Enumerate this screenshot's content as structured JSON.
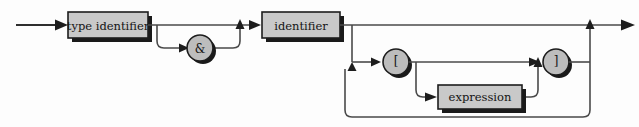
{
  "diagram": {
    "kind": "railroad-syntax-diagram",
    "title": "",
    "background_color": "#fdfdfd",
    "line_color": "#4a4a4a",
    "node_fill": "#c9c9c9",
    "circle_fill": "#bdbdbd",
    "node_border_color": "#1d1d1d",
    "shadow_color": "#1a1a1a",
    "text_color": "#141414",
    "nodes": [
      {
        "id": "type-identifier",
        "shape": "box",
        "label": "type identifier",
        "x": 68,
        "y": 12,
        "w": 80,
        "h": 26
      },
      {
        "id": "ampersand",
        "shape": "circle",
        "label": "&",
        "cx": 200,
        "cy": 48,
        "r": 13
      },
      {
        "id": "identifier",
        "shape": "box",
        "label": "identifier",
        "x": 262,
        "y": 12,
        "w": 78,
        "h": 26
      },
      {
        "id": "open-bracket",
        "shape": "circle",
        "label": "[",
        "cx": 396,
        "cy": 62,
        "r": 13
      },
      {
        "id": "expression",
        "shape": "box",
        "label": "expression",
        "x": 438,
        "y": 85,
        "w": 84,
        "h": 24
      },
      {
        "id": "close-bracket",
        "shape": "circle",
        "label": "]",
        "cx": 556,
        "cy": 62,
        "r": 13
      }
    ],
    "rails": {
      "entry_label": "entry-arrow",
      "exit_label": "exit-arrow",
      "main_rail_y": 25,
      "bracket_rail_y": 62,
      "expression_rail_y": 97,
      "loop_return_y": 117
    }
  }
}
